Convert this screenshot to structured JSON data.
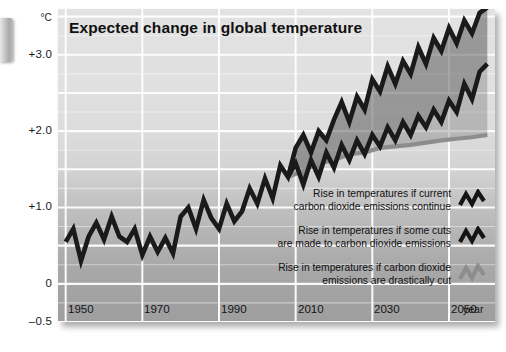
{
  "page": {
    "edge_tab": "page-edge-tab"
  },
  "chart_data": {
    "type": "line",
    "title": "Expected change in global temperature",
    "xlabel": "year",
    "ylabel": "°C",
    "ylim": [
      -0.5,
      3.6
    ],
    "xlim": [
      1948,
      2062
    ],
    "grid": true,
    "legend_position": "inside-bottom-right",
    "y_ticks": [
      "+3.0",
      "+2.0",
      "+1.0",
      "0",
      "–0.5"
    ],
    "y_tick_values": [
      3.0,
      2.0,
      1.0,
      0,
      -0.5
    ],
    "x_ticks": [
      "1950",
      "1970",
      "1990",
      "2010",
      "2030",
      "2050"
    ],
    "x_tick_values": [
      1950,
      1970,
      1990,
      2010,
      2030,
      2050
    ],
    "colors": {
      "line_high": "#1a1a1a",
      "line_mid": "#1a1a1a",
      "line_low": "#8d8d8d",
      "band_high": "#4f4f4f",
      "band_mid": "#6d6d6d",
      "gridline": "#f4f4f4",
      "background_top": "#e2e2e2",
      "background_bottom": "#9e9e9e",
      "title": "#111111"
    },
    "series": [
      {
        "name": "Rise in temperatures if current carbon dioxide emissions continue",
        "key": "high",
        "x": [
          1950,
          1952,
          1954,
          1956,
          1958,
          1960,
          1962,
          1964,
          1966,
          1968,
          1970,
          1972,
          1974,
          1976,
          1978,
          1980,
          1982,
          1984,
          1986,
          1988,
          1990,
          1992,
          1994,
          1996,
          1998,
          2000,
          2002,
          2004,
          2006,
          2008,
          2010,
          2012,
          2014,
          2016,
          2018,
          2020,
          2022,
          2024,
          2026,
          2028,
          2030,
          2032,
          2034,
          2036,
          2038,
          2040,
          2042,
          2044,
          2046,
          2048,
          2050,
          2052,
          2054,
          2056,
          2058,
          2060
        ],
        "values": [
          0.55,
          0.72,
          0.3,
          0.62,
          0.8,
          0.58,
          0.88,
          0.62,
          0.55,
          0.72,
          0.38,
          0.62,
          0.42,
          0.6,
          0.4,
          0.88,
          1.0,
          0.72,
          1.1,
          0.86,
          0.72,
          1.05,
          0.82,
          0.95,
          1.25,
          1.05,
          1.38,
          1.12,
          1.55,
          1.4,
          1.78,
          1.95,
          1.72,
          2.0,
          1.88,
          2.15,
          2.38,
          2.12,
          2.45,
          2.28,
          2.68,
          2.52,
          2.85,
          2.62,
          2.92,
          2.75,
          3.1,
          2.88,
          3.22,
          3.05,
          3.35,
          3.15,
          3.45,
          3.28,
          3.55,
          3.62
        ]
      },
      {
        "name": "Rise in temperatures if some cuts are made to carbon dioxide emissions",
        "key": "mid",
        "x": [
          2008,
          2010,
          2012,
          2014,
          2016,
          2018,
          2020,
          2022,
          2024,
          2026,
          2028,
          2030,
          2032,
          2034,
          2036,
          2038,
          2040,
          2042,
          2044,
          2046,
          2048,
          2050,
          2052,
          2054,
          2056,
          2058,
          2060
        ],
        "values": [
          1.4,
          1.58,
          1.3,
          1.62,
          1.4,
          1.72,
          1.52,
          1.82,
          1.62,
          1.88,
          1.7,
          1.95,
          1.8,
          2.05,
          1.88,
          2.12,
          1.95,
          2.2,
          2.05,
          2.28,
          2.12,
          2.4,
          2.25,
          2.62,
          2.42,
          2.78,
          2.88
        ]
      },
      {
        "name": "Rise in temperatures if carbon dioxide emissions are drastically cut",
        "key": "low",
        "x": [
          2008,
          2012,
          2016,
          2020,
          2024,
          2028,
          2032,
          2036,
          2040,
          2044,
          2048,
          2052,
          2056,
          2060
        ],
        "values": [
          1.4,
          1.48,
          1.58,
          1.62,
          1.7,
          1.72,
          1.78,
          1.8,
          1.82,
          1.85,
          1.88,
          1.9,
          1.92,
          1.95
        ]
      }
    ],
    "legend": [
      {
        "line1": "Rise in temperatures if current",
        "line2": "carbon dioxide emissions continue",
        "swatch": "zigzag-dark-icon"
      },
      {
        "line1": "Rise in temperatures if some cuts",
        "line2": "are made to carbon dioxide emissions",
        "swatch": "zigzag-dark-icon"
      },
      {
        "line1": "Rise in temperatures if carbon dioxide",
        "line2": "emissions are drastically cut",
        "swatch": "zigzag-grey-icon"
      }
    ]
  }
}
